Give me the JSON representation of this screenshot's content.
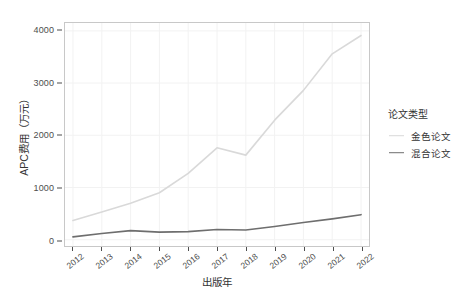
{
  "chart_data": {
    "type": "line",
    "title": "",
    "xlabel": "出版年",
    "ylabel": "APC费用（万元）",
    "x": [
      2012,
      2013,
      2014,
      2015,
      2016,
      2017,
      2018,
      2019,
      2020,
      2021,
      2022
    ],
    "xtick_labels": [
      "2012",
      "2013",
      "2014",
      "2015",
      "2016",
      "2017",
      "2018",
      "2019",
      "2020",
      "2021",
      "2022"
    ],
    "ytick_labels": [
      "0",
      "1000",
      "2000",
      "3000",
      "4000"
    ],
    "yticks": [
      0,
      1000,
      2000,
      3000,
      4000
    ],
    "xlim": [
      2012,
      2022
    ],
    "ylim": [
      -120,
      4150
    ],
    "grid": true,
    "legend_position": "right",
    "legend_title": "论文类型",
    "series": [
      {
        "name": "金色论文",
        "color": "#d9d9d9",
        "values": [
          370,
          530,
          700,
          900,
          1270,
          1760,
          1620,
          2290,
          2860,
          3560,
          3910
        ]
      },
      {
        "name": "混合论文",
        "color": "#6e6e6e",
        "values": [
          55,
          120,
          175,
          145,
          155,
          195,
          185,
          255,
          330,
          400,
          480
        ]
      }
    ]
  },
  "legend": {
    "title": "论文类型",
    "entries": [
      {
        "label": "金色论文",
        "color": "#d9d9d9"
      },
      {
        "label": "混合论文",
        "color": "#6e6e6e"
      }
    ]
  },
  "axes": {
    "y_title": "APC费用（万元）",
    "x_title": "出版年"
  },
  "colors": {
    "panel_background": "#ffffff",
    "panel_border": "#c8c8c8",
    "grid": "#f2f2f2",
    "text": "#4d4d4d",
    "gold_series": "#d9d9d9",
    "hybrid_series": "#6e6e6e"
  }
}
